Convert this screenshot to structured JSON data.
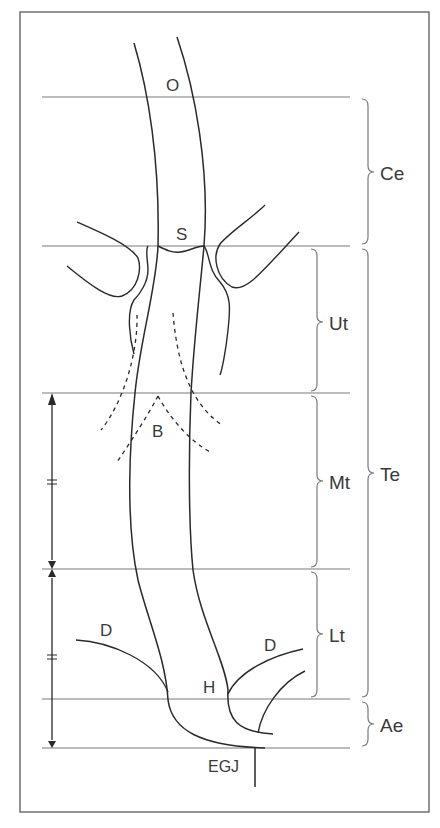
{
  "diagram": {
    "kind": "esophagus anatomical subdivision",
    "colors": {
      "line": "#2a2a2a",
      "guide": "#7a7a7a",
      "frame": "#5a5a5a",
      "text": "#3a3a3a"
    },
    "landmarks": {
      "O": "O",
      "S": "S",
      "B": "B",
      "D_left": "D",
      "D_right": "D",
      "H": "H",
      "EGJ": "EGJ"
    },
    "segments": {
      "Ce": "Ce",
      "Ut": "Ut",
      "Mt": "Mt",
      "Lt": "Lt",
      "Te": "Te",
      "Ae": "Ae"
    },
    "level_lines_y": [
      97,
      246,
      393,
      569,
      699,
      748
    ],
    "equal_marks": [
      "=",
      "="
    ]
  }
}
